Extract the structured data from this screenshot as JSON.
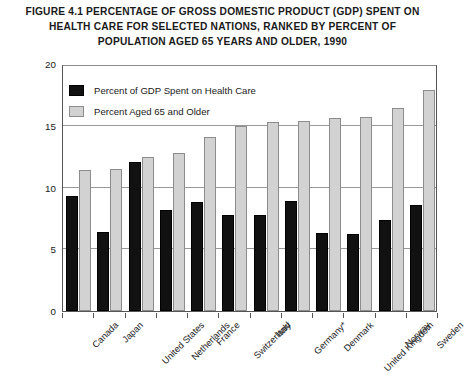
{
  "title": {
    "line1": "FIGURE 4.1   PERCENTAGE OF GROSS DOMESTIC PRODUCT (GDP) SPENT ON",
    "line2": "HEALTH CARE FOR SELECTED NATIONS, RANKED BY PERCENT OF",
    "line3": "POPULATION AGED 65 YEARS AND OLDER, 1990"
  },
  "legend": {
    "series1_label": "Percent of GDP Spent on Health Care",
    "series2_label": "Percent Aged 65 and Older",
    "series1_color": "#111111",
    "series2_color": "#d2d2d2"
  },
  "axes": {
    "ylabel": "Percent",
    "yticks": [
      "0",
      "5",
      "10",
      "15",
      "20"
    ]
  },
  "chart_data": {
    "type": "bar",
    "title": "FIGURE 4.1 PERCENTAGE OF GROSS DOMESTIC PRODUCT (GDP) SPENT ON HEALTH CARE FOR SELECTED NATIONS, RANKED BY PERCENT OF POPULATION AGED 65 YEARS AND OLDER, 1990",
    "xlabel": "",
    "ylabel": "Percent",
    "ylim": [
      0,
      20
    ],
    "yticks": [
      0,
      5,
      10,
      15,
      20
    ],
    "grid": true,
    "legend_position": "upper-left-inside",
    "categories": [
      "Canada",
      "Japan",
      "United States",
      "Netherlands",
      "France",
      "Switzerland",
      "Italy",
      "Germany*",
      "Denmark",
      "United Kingdom",
      "Norway",
      "Sweden"
    ],
    "series": [
      {
        "name": "Percent of GDP Spent on Health Care",
        "color": "#111111",
        "values": [
          9.3,
          6.4,
          12.1,
          8.2,
          8.8,
          7.8,
          7.8,
          8.9,
          6.3,
          6.2,
          7.4,
          8.6
        ]
      },
      {
        "name": "Percent Aged 65 and Older",
        "color": "#d2d2d2",
        "values": [
          11.4,
          11.5,
          12.5,
          12.8,
          14.1,
          15.0,
          15.3,
          15.4,
          15.6,
          15.7,
          16.4,
          17.9
        ]
      }
    ]
  }
}
